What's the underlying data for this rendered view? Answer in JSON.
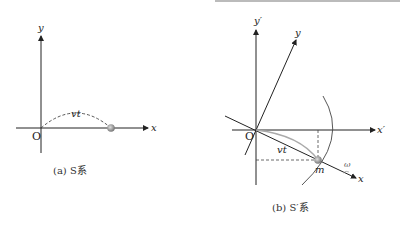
{
  "panel_a": {
    "caption": "(a) S系",
    "axis_x": "x",
    "axis_y": "y",
    "origin": "O",
    "arc_label": "vt"
  },
  "panel_b": {
    "caption": "(b) S′系",
    "axis_x_prime": "x′",
    "axis_y_prime": "y′",
    "axis_x": "x",
    "axis_y": "y",
    "origin": "O",
    "segment_label": "vt",
    "mass_label": "m",
    "angular_velocity_label": "ω"
  },
  "colors": {
    "line": "#222222",
    "ball": "#888888",
    "trajectory": "#aaaaaa",
    "top_bar": "#bbbbbb"
  }
}
